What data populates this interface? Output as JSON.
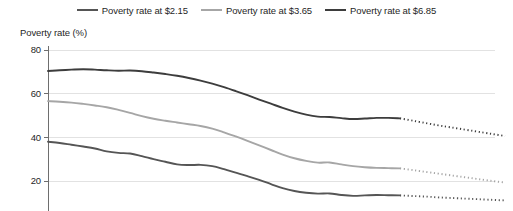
{
  "chart_data": {
    "type": "line",
    "title": "",
    "ylabel": "Poverty rate (%)",
    "xlabel": "",
    "ylim": [
      0,
      80
    ],
    "yticks": [
      20,
      40,
      60,
      80
    ],
    "ytick_labels": [
      "20",
      "40",
      "60",
      "80"
    ],
    "grid": "horizontal",
    "legend_position": "top-center",
    "note": "Solid segments are historical estimates; dotted segments are projections.",
    "x": [
      0,
      1,
      2,
      3,
      4,
      5,
      6,
      7,
      8,
      9,
      10,
      11,
      12,
      13,
      14,
      15,
      16,
      17,
      18,
      19,
      20,
      21,
      22,
      23,
      24,
      25,
      26,
      27,
      28,
      29,
      30
    ],
    "projection_starts_at_index": 22,
    "series": [
      {
        "name": "Poverty rate at $2.15",
        "color": "#555555",
        "values": [
          38.0,
          37.4,
          36.6,
          35.8,
          34.9,
          33.6,
          32.9,
          32.6,
          31.4,
          30.0,
          28.8,
          27.6,
          27.3,
          27.4,
          26.8,
          25.4,
          23.8,
          22.2,
          20.5,
          18.6,
          16.7,
          15.4,
          14.6,
          14.2,
          14.3,
          13.6,
          13.2,
          13.4,
          13.6,
          13.5,
          13.4
        ]
      },
      {
        "name": "Poverty rate at $3.65",
        "color": "#a6a6a6",
        "values": [
          56.6,
          56.3,
          55.9,
          55.3,
          54.6,
          53.8,
          52.6,
          51.2,
          49.7,
          48.5,
          47.6,
          46.8,
          46.0,
          45.2,
          44.0,
          42.3,
          40.4,
          38.4,
          36.3,
          34.2,
          32.1,
          30.4,
          29.2,
          28.4,
          28.5,
          27.6,
          26.8,
          26.3,
          26.0,
          25.9,
          25.8
        ]
      },
      {
        "name": "Poverty rate at $6.85",
        "color": "#3d3d3d",
        "values": [
          70.4,
          70.7,
          71.0,
          71.2,
          71.0,
          70.7,
          70.5,
          70.6,
          70.3,
          69.7,
          69.0,
          68.2,
          67.2,
          66.0,
          64.6,
          63.0,
          61.2,
          59.3,
          57.3,
          55.4,
          53.5,
          51.8,
          50.4,
          49.5,
          49.3,
          48.8,
          48.4,
          48.6,
          48.9,
          48.9,
          48.7
        ]
      }
    ],
    "projection": [
      {
        "name": "Poverty rate at $2.15",
        "color": "#555555",
        "values": [
          13.4,
          13.2,
          13.0,
          12.8,
          12.5,
          12.3,
          12.1,
          11.9,
          11.7,
          11.5,
          11.3,
          11.1
        ]
      },
      {
        "name": "Poverty rate at $3.65",
        "color": "#a6a6a6",
        "values": [
          25.8,
          25.2,
          24.6,
          24.0,
          23.4,
          22.8,
          22.2,
          21.6,
          21.0,
          20.4,
          19.8,
          19.3
        ]
      },
      {
        "name": "Poverty rate at $6.85",
        "color": "#3d3d3d",
        "values": [
          48.7,
          47.9,
          47.1,
          46.3,
          45.5,
          44.8,
          44.1,
          43.4,
          42.7,
          42.0,
          41.3,
          40.6
        ]
      }
    ]
  },
  "legend": {
    "items": [
      {
        "label": "Poverty rate at $2.15",
        "color": "#555555"
      },
      {
        "label": "Poverty rate at $3.65",
        "color": "#a6a6a6"
      },
      {
        "label": "Poverty rate at $6.85",
        "color": "#3d3d3d"
      }
    ]
  },
  "axis": {
    "y_title": "Poverty rate (%)",
    "y_ticks": [
      "80",
      "60",
      "40",
      "20"
    ]
  }
}
